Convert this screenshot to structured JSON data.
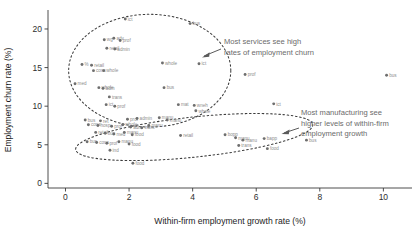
{
  "chart_data": {
    "type": "scatter",
    "title": "",
    "xlabel": "Within-firm employment growth rate (%)",
    "ylabel": "Employment churn rate (%)",
    "xlim": [
      -0.55,
      10.9
    ],
    "ylim": [
      -0.6,
      22.2
    ],
    "xticks": [
      0,
      2,
      4,
      6,
      8,
      10
    ],
    "yticks": [
      0,
      5,
      10,
      15,
      20
    ],
    "grid": false,
    "legend": false,
    "point_color": "#6e6e6e",
    "label_color": "#8d8d8d",
    "points": [
      {
        "label": "ict",
        "x": 1.88,
        "y": 21.3
      },
      {
        "label": "bus",
        "x": 3.92,
        "y": 20.7
      },
      {
        "label": "wg",
        "x": 1.22,
        "y": 18.6
      },
      {
        "label": "adv",
        "x": 1.52,
        "y": 18.8
      },
      {
        "label": "prof",
        "x": 1.72,
        "y": 18.5
      },
      {
        "label": "retail",
        "x": 1.3,
        "y": 17.5
      },
      {
        "label": "admin",
        "x": 1.55,
        "y": 17.4
      },
      {
        "label": "whole",
        "x": 3.05,
        "y": 15.6
      },
      {
        "label": "ict",
        "x": 4.2,
        "y": 15.5
      },
      {
        "label": "%",
        "x": 0.52,
        "y": 15.4
      },
      {
        "label": "retail",
        "x": 0.82,
        "y": 15.3
      },
      {
        "label": "cons",
        "x": 0.88,
        "y": 14.6
      },
      {
        "label": "whole",
        "x": 1.2,
        "y": 14.6
      },
      {
        "label": "prof",
        "x": 5.65,
        "y": 14.1
      },
      {
        "label": "med",
        "x": 0.3,
        "y": 12.9
      },
      {
        "label": "whole",
        "x": 1.05,
        "y": 12.4
      },
      {
        "label": "adm",
        "x": 1.18,
        "y": 12.3
      },
      {
        "label": "bus",
        "x": 3.1,
        "y": 12.4
      },
      {
        "label": "trans",
        "x": 1.38,
        "y": 11.2
      },
      {
        "label": "ict",
        "x": 1.28,
        "y": 10.2
      },
      {
        "label": "prof",
        "x": 1.55,
        "y": 10.0
      },
      {
        "label": "mat",
        "x": 3.55,
        "y": 10.2
      },
      {
        "label": "wneh",
        "x": 4.05,
        "y": 10.1
      },
      {
        "label": "whole",
        "x": 4.1,
        "y": 9.4
      },
      {
        "label": "ict",
        "x": 6.55,
        "y": 10.3
      },
      {
        "label": "bus",
        "x": 0.62,
        "y": 8.2
      },
      {
        "label": "ret",
        "x": 1.1,
        "y": 8.1
      },
      {
        "label": "prof",
        "x": 1.95,
        "y": 8.3
      },
      {
        "label": "admin",
        "x": 2.25,
        "y": 8.4
      },
      {
        "label": "manu",
        "x": 2.95,
        "y": 8.5
      },
      {
        "label": "manu",
        "x": 3.2,
        "y": 8.2
      },
      {
        "label": "cons",
        "x": 0.72,
        "y": 7.6
      },
      {
        "label": "hosp",
        "x": 1.02,
        "y": 7.5
      },
      {
        "label": "prof",
        "x": 1.45,
        "y": 7.4
      },
      {
        "label": "whole",
        "x": 1.8,
        "y": 7.6
      },
      {
        "label": "adm",
        "x": 2.05,
        "y": 7.3
      },
      {
        "label": "trans",
        "x": 2.4,
        "y": 7.2
      },
      {
        "label": "manu",
        "x": 2.62,
        "y": 7.5
      },
      {
        "label": "retail",
        "x": 0.95,
        "y": 6.6
      },
      {
        "label": "bus",
        "x": 1.25,
        "y": 6.5
      },
      {
        "label": "med",
        "x": 1.52,
        "y": 6.4
      },
      {
        "label": "manu",
        "x": 1.85,
        "y": 6.6
      },
      {
        "label": "food",
        "x": 2.1,
        "y": 6.3
      },
      {
        "label": "retail",
        "x": 3.62,
        "y": 6.2
      },
      {
        "label": "bopp",
        "x": 5.02,
        "y": 6.3
      },
      {
        "label": "manu",
        "x": 5.35,
        "y": 5.9
      },
      {
        "label": "manu",
        "x": 5.58,
        "y": 5.6
      },
      {
        "label": "bapp",
        "x": 6.25,
        "y": 5.8
      },
      {
        "label": "bus",
        "x": 7.58,
        "y": 5.6
      },
      {
        "label": "bus",
        "x": 0.68,
        "y": 5.4
      },
      {
        "label": "cons",
        "x": 0.98,
        "y": 5.3
      },
      {
        "label": "prof",
        "x": 1.3,
        "y": 5.2
      },
      {
        "label": "manu",
        "x": 1.68,
        "y": 5.4
      },
      {
        "label": "food",
        "x": 2.0,
        "y": 5.1
      },
      {
        "label": "trans",
        "x": 5.45,
        "y": 4.9
      },
      {
        "label": "ind",
        "x": 1.4,
        "y": 4.3
      },
      {
        "label": "food",
        "x": 6.35,
        "y": 4.5
      },
      {
        "label": "food",
        "x": 2.12,
        "y": 2.6
      },
      {
        "label": "bus",
        "x": 10.1,
        "y": 14.0
      }
    ],
    "ellipses": [
      {
        "name": "services-cluster",
        "cx": 2.65,
        "cy": 14.6,
        "rx": 2.55,
        "ry": 7.3,
        "rotation": 0
      },
      {
        "name": "manufacturing-cluster",
        "cx": 4.05,
        "cy": 6.0,
        "rx": 3.75,
        "ry": 2.6,
        "rotation": -6
      }
    ],
    "annotations": [
      {
        "name": "services-annotation",
        "lines": [
          "Most services see high",
          "rates of employment churn"
        ]
      },
      {
        "name": "manufacturing-annotation",
        "lines": [
          "Most manufacturing see",
          "higher levels of within-firm",
          "employment growth"
        ]
      }
    ]
  }
}
